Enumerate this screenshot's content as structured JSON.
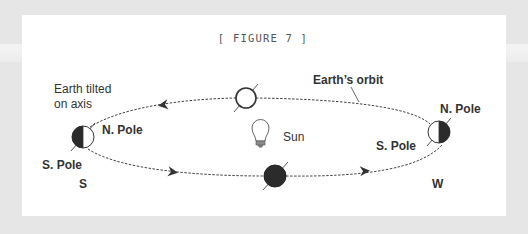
{
  "figure": {
    "title": "[ FIGURE 7 ]"
  },
  "labels": {
    "earth_tilted_line1": "Earth tilted",
    "earth_tilted_line2": "on axis",
    "earths_orbit": "Earth’s orbit",
    "sun": "Sun",
    "left_north_pole": "N. Pole",
    "left_south_pole": "S. Pole",
    "left_direction": "S",
    "right_north_pole": "N. Pole",
    "right_south_pole": "S. Pole",
    "right_direction": "W"
  },
  "icons": {
    "sun": "light-bulb-icon",
    "earth_top": "earth-fully-lit",
    "earth_bottom": "earth-fully-dark",
    "earth_left": "earth-left-half-dark",
    "earth_right": "earth-right-half-dark"
  },
  "colors": {
    "background": "#e6e6e6",
    "panel": "#ffffff",
    "ink": "#333333",
    "earth_dark": "#2b2b2b"
  }
}
